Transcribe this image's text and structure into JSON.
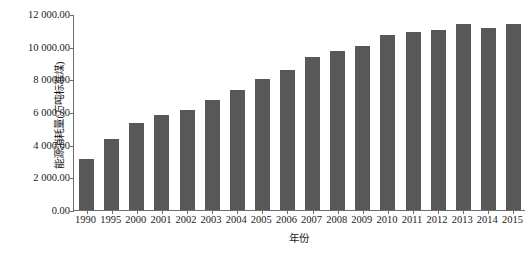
{
  "chart_data": {
    "type": "bar",
    "title": "",
    "xlabel": "年份",
    "ylabel": "能源消耗量(万吨标准煤)",
    "categories": [
      "1990",
      "1995",
      "2000",
      "2001",
      "2002",
      "2003",
      "2004",
      "2005",
      "2006",
      "2007",
      "2008",
      "2009",
      "2010",
      "2011",
      "2012",
      "2013",
      "2014",
      "2015"
    ],
    "values": [
      3150,
      4350,
      5350,
      5800,
      6150,
      6750,
      7350,
      8000,
      8600,
      9350,
      9750,
      10050,
      10700,
      10900,
      11050,
      11400,
      11150,
      11400
    ],
    "series": [
      {
        "name": "能源消耗量",
        "values": [
          3150,
          4350,
          5350,
          5800,
          6150,
          6750,
          7350,
          8000,
          8600,
          9350,
          9750,
          10050,
          10700,
          10900,
          11050,
          11400,
          11150,
          11400
        ]
      }
    ],
    "ylim": [
      0,
      12000
    ],
    "ytick_values": [
      0,
      2000,
      4000,
      6000,
      8000,
      10000,
      12000
    ],
    "ytick_labels": [
      "0.00",
      "2 000.00",
      "4 000.00",
      "6 000.00",
      "8 000.00",
      "10 000.00",
      "12 000.00"
    ],
    "grid": false,
    "legend": false,
    "legend_position": "none",
    "bar_color": "#585858",
    "axis_color": "#6e6e6e",
    "background_color": "#ffffff"
  }
}
